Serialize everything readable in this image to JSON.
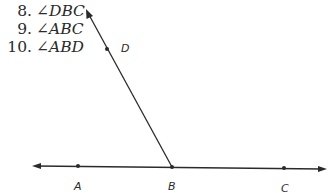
{
  "questions": [
    {
      "number": "8.",
      "angle": "∠DBC"
    },
    {
      "number": "9.",
      "angle": "∠ABC"
    },
    {
      "number": "10.",
      "angle": "∠ABD"
    }
  ],
  "diagram": {
    "points": {
      "A": {
        "label": "A",
        "x": 78,
        "y": 166
      },
      "B": {
        "label": "B",
        "x": 172,
        "y": 167
      },
      "C": {
        "label": "C",
        "x": 284,
        "y": 168
      },
      "D": {
        "label": "D",
        "x": 107,
        "y": 49
      }
    },
    "line_color": "#2a2a2a"
  }
}
